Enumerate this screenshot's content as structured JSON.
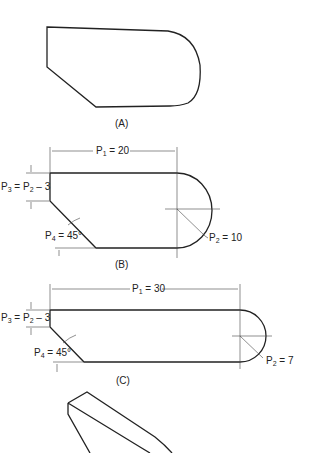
{
  "figures": [
    {
      "id": "A",
      "caption": "(A)"
    },
    {
      "id": "B",
      "caption": "(B)",
      "p1": {
        "sym": "P",
        "sub": "1",
        "val": " = 20"
      },
      "p2": {
        "sym": "P",
        "sub": "2",
        "val": " = 10"
      },
      "p3": {
        "text1": "P",
        "sub1": "3",
        "mid": " = P",
        "sub2": "2",
        "tail": " – 3"
      },
      "p4": {
        "sym": "P",
        "sub": "4",
        "val": " = 45°"
      }
    },
    {
      "id": "C",
      "caption": "(C)",
      "p1": {
        "sym": "P",
        "sub": "1",
        "val": " = 30"
      },
      "p2": {
        "sym": "P",
        "sub": "2",
        "val": " = 7"
      },
      "p3": {
        "text1": "P",
        "sub1": "3",
        "mid": " = P",
        "sub2": "2",
        "tail": " – 3"
      },
      "p4": {
        "sym": "P",
        "sub": "4",
        "val": " = 45°"
      }
    },
    {
      "id": "D",
      "caption": ""
    }
  ],
  "colors": {
    "line": "#222222",
    "dim": "#444444"
  }
}
